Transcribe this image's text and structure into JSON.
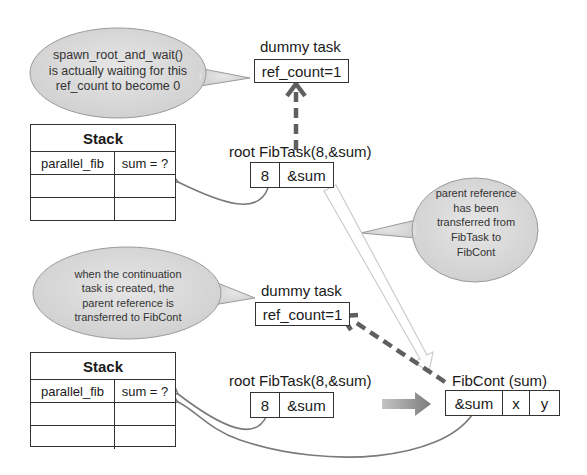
{
  "top_section": {
    "callout_wait": "spawn_root_and_wait() is actually waiting for this ref_count to become 0",
    "callout_wait_lines": [
      "spawn_root_and_wait()",
      "is actually waiting for this",
      "ref_count to become 0"
    ],
    "dummy_task": {
      "label": "dummy task",
      "value": "ref_count=1"
    },
    "stack": {
      "title": "Stack",
      "rows": [
        [
          "parallel_fib",
          "sum = ?"
        ],
        [
          "",
          ""
        ],
        [
          "",
          ""
        ]
      ]
    },
    "root_task": {
      "label": "root FibTask(8,&sum)",
      "cells": [
        "8",
        "&sum"
      ]
    }
  },
  "transfer_callout": {
    "lines": [
      "parent reference",
      "has been",
      "transferred from",
      "FibTask to",
      "FibCont"
    ]
  },
  "bottom_section": {
    "callout_continuation_lines": [
      "when the continuation",
      "task is created, the",
      "parent reference is",
      "transferred to FibCont"
    ],
    "dummy_task": {
      "label": "dummy task",
      "value": "ref_count=1"
    },
    "stack": {
      "title": "Stack",
      "rows": [
        [
          "parallel_fib",
          "sum = ?"
        ],
        [
          "",
          ""
        ],
        [
          "",
          ""
        ]
      ]
    },
    "root_task": {
      "label": "root FibTask(8,&sum)",
      "cells": [
        "8",
        "&sum"
      ]
    },
    "continuation": {
      "label": "FibCont (sum)",
      "cells": [
        "&sum",
        "x",
        "y"
      ]
    }
  },
  "colors": {
    "callout_fill": "#d9d9d9",
    "callout_stroke": "#9a9a9a",
    "dashed_arrow": "#5f5f5f",
    "link_curve": "#7a7a7a",
    "hollow_arrow": "#cfcfcf",
    "block_arrow": "#8c8c8c"
  }
}
